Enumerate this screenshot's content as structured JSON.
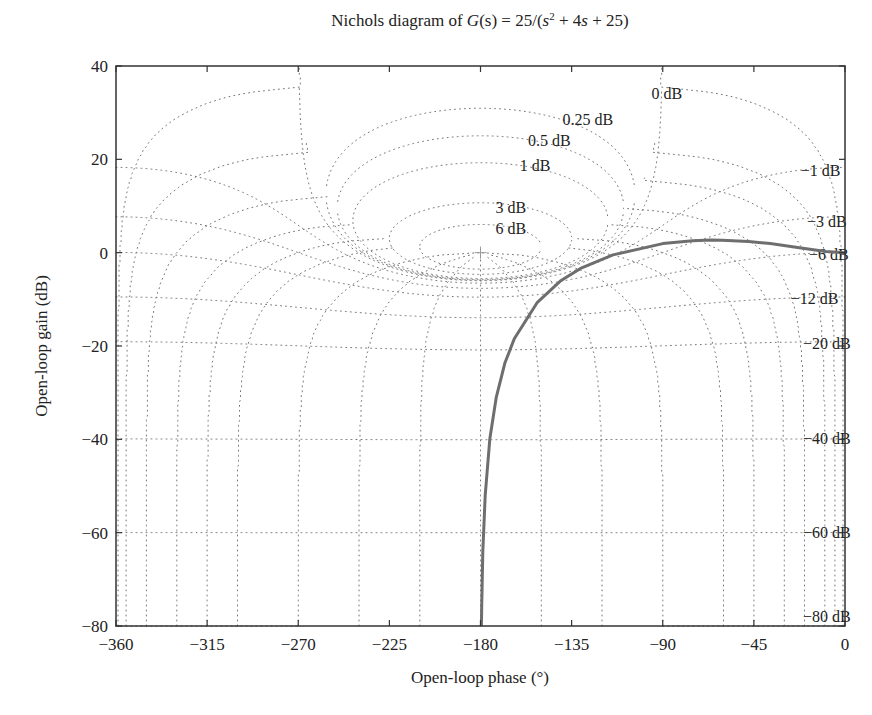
{
  "chart_data": {
    "type": "line",
    "title_parts": {
      "prefix": "Nichols diagram of ",
      "G": "G",
      "s_arg": "(s)",
      "eq": " = 25/(",
      "s1": "s",
      "sup": "2",
      "mid": " + 4",
      "s2": "s",
      "suffix": " + 25)"
    },
    "xlabel": "Open-loop phase (°)",
    "ylabel": "Open-loop gain (dB)",
    "xlim": [
      -360,
      0
    ],
    "ylim": [
      -80,
      40
    ],
    "xticks": [
      -360,
      -315,
      -270,
      -225,
      -180,
      -135,
      -90,
      -45,
      0
    ],
    "xtick_labels": [
      "−360",
      "−315",
      "−270",
      "−225",
      "−180",
      "−135",
      "−90",
      "−45",
      "0"
    ],
    "yticks": [
      40,
      20,
      0,
      -20,
      -40,
      -60,
      -80
    ],
    "ytick_labels": [
      "40",
      "20",
      "0",
      "−20",
      "−40",
      "−60",
      "−80"
    ],
    "grid": "nichols",
    "critical_point": {
      "phase": -180,
      "gain": 0,
      "marker": "+"
    },
    "closed_loop_magnitude_contours_dB": [
      6,
      3,
      1,
      0.5,
      0.25,
      0,
      -1,
      -3,
      -6,
      -12,
      -20,
      -40,
      -60,
      -80
    ],
    "contour_labels": [
      {
        "text": "0 dB",
        "phase": -88,
        "gain": 34
      },
      {
        "text": "0.25 dB",
        "phase": -127,
        "gain": 28.5
      },
      {
        "text": "0.5 dB",
        "phase": -146,
        "gain": 24
      },
      {
        "text": "1 dB",
        "phase": -153,
        "gain": 18.5
      },
      {
        "text": "3 dB",
        "phase": -165,
        "gain": 9.5
      },
      {
        "text": "6 dB",
        "phase": -165,
        "gain": 5
      },
      {
        "text": "−1 dB",
        "phase": -12,
        "gain": 17.5
      },
      {
        "text": "−3 dB",
        "phase": -9,
        "gain": 6.5
      },
      {
        "text": "−6 dB",
        "phase": -8,
        "gain": -0.5
      },
      {
        "text": "−12 dB",
        "phase": -15,
        "gain": -10
      },
      {
        "text": "−20 dB",
        "phase": -9,
        "gain": -19.5
      },
      {
        "text": "−40 dB",
        "phase": -9,
        "gain": -40
      },
      {
        "text": "−60 dB",
        "phase": -9,
        "gain": -60
      },
      {
        "text": "−80 dB",
        "phase": -9,
        "gain": -78
      }
    ],
    "series": [
      {
        "name": "G(jω)",
        "color": "#6e6e6e",
        "phase": [
          0,
          -9.46,
          -20.85,
          -36.87,
          -47.68,
          -60.64,
          -66.3,
          -75.2,
          -90,
          -114.6,
          -130.6,
          -140.6,
          -151.9,
          -163.3,
          -168.0,
          -172.2,
          -175.4,
          -177.7,
          -178.85,
          -179.43,
          -179.54
        ],
        "gain": [
          0,
          0.24,
          0.93,
          1.94,
          2.41,
          2.68,
          2.69,
          2.56,
          1.94,
          -0.47,
          -3.38,
          -6.1,
          -10.63,
          -18.44,
          -23.71,
          -30.96,
          -39.94,
          -52.03,
          -64.07,
          -76.1,
          -80.0
        ]
      }
    ]
  }
}
